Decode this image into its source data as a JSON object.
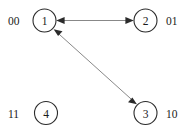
{
  "diagram": {
    "type": "state-transition-graph",
    "background_color": "#ffffff",
    "node_stroke_color": "#2b2b2b",
    "edge_color": "#7a7a7a",
    "arrow_color": "#2b2b2b",
    "text_color": "#1a1a1a",
    "nodes": [
      {
        "id": "1",
        "label": "1",
        "cx": 44.5,
        "cy": 20.5,
        "r": 11.5
      },
      {
        "id": "2",
        "label": "2",
        "cx": 145.5,
        "cy": 20.5,
        "r": 11.5
      },
      {
        "id": "3",
        "label": "3",
        "cx": 145.5,
        "cy": 113.0,
        "r": 11.5
      },
      {
        "id": "4",
        "label": "4",
        "cx": 46.0,
        "cy": 113.0,
        "r": 11.5
      }
    ],
    "corner_labels": [
      {
        "name": "label-00",
        "text": "00",
        "x": 8,
        "y": 20.5,
        "position": "top-left"
      },
      {
        "name": "label-01",
        "text": "01",
        "x": 166,
        "y": 20.5,
        "position": "top-right"
      },
      {
        "name": "label-11",
        "text": "11",
        "x": 8,
        "y": 113.0,
        "position": "bottom-left"
      },
      {
        "name": "label-10",
        "text": "10",
        "x": 166,
        "y": 113.0,
        "position": "bottom-right"
      }
    ],
    "edges": [
      {
        "id": "edge-1-2",
        "from": "1",
        "to": "2",
        "bidirectional": true,
        "x1": 56.0,
        "y1": 20.5,
        "x2": 134.0,
        "y2": 20.5
      },
      {
        "id": "edge-1-3",
        "from": "1",
        "to": "3",
        "bidirectional": true,
        "x1": 53.5,
        "y1": 29.0,
        "x2": 137.0,
        "y2": 104.5
      }
    ]
  }
}
